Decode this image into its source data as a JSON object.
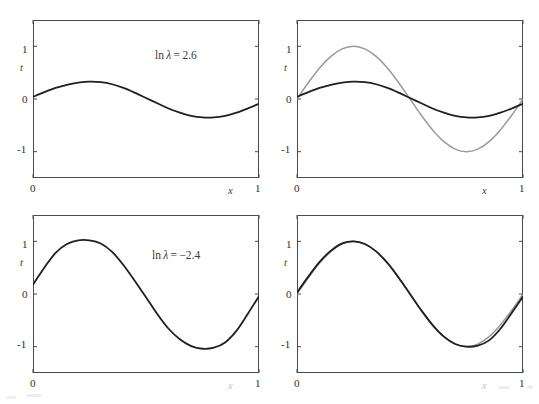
{
  "figure": {
    "title": "",
    "background_color": "#ffffff",
    "width": 539,
    "height": 404
  },
  "style": {
    "true_curve_color": "#9a9a9a",
    "fit_curve_color": "#6e6e6e",
    "average_curve_color": "#1f1f1f",
    "frame_color": "#4a4a4a",
    "text_color": "#2f2f2f"
  },
  "panels": [
    {
      "id": "top-left",
      "role": "individual-fits",
      "annotation_prefix": "ln",
      "annotation_symbol": "λ",
      "annotation_equals": "=",
      "annotation_value": "2.6",
      "annotation_full": "ln λ = 2.6",
      "xlabel": "x",
      "ylabel": "t",
      "xticks": [
        "0",
        "1"
      ],
      "yticks": [
        "1",
        "0",
        "-1"
      ],
      "xlabel_faded": false,
      "xticks_faded": false
    },
    {
      "id": "top-right",
      "role": "average-vs-truth",
      "annotation_full": "",
      "xlabel": "x",
      "ylabel": "t",
      "xticks": [
        "0",
        "1"
      ],
      "yticks": [
        "1",
        "0",
        "-1"
      ],
      "xlabel_faded": false,
      "xticks_faded": false
    },
    {
      "id": "bottom-left",
      "role": "individual-fits",
      "annotation_prefix": "ln",
      "annotation_symbol": "λ",
      "annotation_equals": "=",
      "annotation_value": "−2.4",
      "annotation_full": "ln λ = −2.4",
      "xlabel": "x",
      "ylabel": "t",
      "xticks": [
        "0",
        "1"
      ],
      "yticks": [
        "1",
        "0",
        "-1"
      ],
      "xlabel_faded": true,
      "xticks_faded": false
    },
    {
      "id": "bottom-right",
      "role": "average-vs-truth",
      "annotation_full": "",
      "xlabel": "x",
      "ylabel": "t",
      "xticks": [
        "0",
        "1"
      ],
      "yticks": [
        "1",
        "0",
        "-1"
      ],
      "xlabel_faded": true,
      "xticks_faded": false
    }
  ],
  "chart_data": {
    "type": "line",
    "xlabel": "x",
    "ylabel": "t",
    "xlim": [
      0,
      1
    ],
    "ylim": [
      -1.5,
      1.5
    ],
    "grid": false,
    "legend": "none",
    "true_function": {
      "name": "sin(2πx)",
      "amplitude": 1.0,
      "periods": 1,
      "color": "#9a9a9a",
      "x": [
        0,
        0.05,
        0.1,
        0.15,
        0.2,
        0.25,
        0.3,
        0.35,
        0.4,
        0.45,
        0.5,
        0.55,
        0.6,
        0.65,
        0.7,
        0.75,
        0.8,
        0.85,
        0.9,
        0.95,
        1.0
      ],
      "y": [
        0.0,
        0.309,
        0.588,
        0.809,
        0.951,
        1.0,
        0.951,
        0.809,
        0.588,
        0.309,
        0.0,
        -0.309,
        -0.588,
        -0.809,
        -0.951,
        -1.0,
        -0.951,
        -0.809,
        -0.588,
        -0.309,
        0.0
      ]
    },
    "panels": [
      {
        "id": "top-left",
        "position": "top-left",
        "annotation": "ln λ = 2.6",
        "ln_lambda": 2.6,
        "shows": "20 individual regularized fits",
        "num_curves": 20,
        "variance": "low",
        "bias": "high",
        "series": [
          {
            "name": "mean-fit",
            "color": "#1f1f1f",
            "x": [
              0,
              0.05,
              0.1,
              0.15,
              0.2,
              0.25,
              0.3,
              0.35,
              0.4,
              0.45,
              0.5,
              0.55,
              0.6,
              0.65,
              0.7,
              0.75,
              0.8,
              0.85,
              0.9,
              0.95,
              1.0
            ],
            "y": [
              0.04,
              0.13,
              0.21,
              0.27,
              0.31,
              0.33,
              0.32,
              0.28,
              0.21,
              0.12,
              0.02,
              -0.08,
              -0.18,
              -0.26,
              -0.32,
              -0.35,
              -0.35,
              -0.32,
              -0.26,
              -0.18,
              -0.09
            ]
          }
        ],
        "spread_amplitude": 0.09
      },
      {
        "id": "top-right",
        "position": "top-right",
        "annotation": "",
        "ln_lambda": 2.6,
        "shows": "average fit versus true sinusoid",
        "num_curves": 2,
        "series": [
          {
            "name": "true-sinusoid",
            "color": "#9a9a9a",
            "x": [
              0,
              0.05,
              0.1,
              0.15,
              0.2,
              0.25,
              0.3,
              0.35,
              0.4,
              0.45,
              0.5,
              0.55,
              0.6,
              0.65,
              0.7,
              0.75,
              0.8,
              0.85,
              0.9,
              0.95,
              1.0
            ],
            "y": [
              0.0,
              0.309,
              0.588,
              0.809,
              0.951,
              1.0,
              0.951,
              0.809,
              0.588,
              0.309,
              0.0,
              -0.309,
              -0.588,
              -0.809,
              -0.951,
              -1.0,
              -0.951,
              -0.809,
              -0.588,
              -0.309,
              0.0
            ]
          },
          {
            "name": "average-fit",
            "color": "#1f1f1f",
            "x": [
              0,
              0.05,
              0.1,
              0.15,
              0.2,
              0.25,
              0.3,
              0.35,
              0.4,
              0.45,
              0.5,
              0.55,
              0.6,
              0.65,
              0.7,
              0.75,
              0.8,
              0.85,
              0.9,
              0.95,
              1.0
            ],
            "y": [
              0.04,
              0.13,
              0.21,
              0.27,
              0.31,
              0.33,
              0.32,
              0.28,
              0.21,
              0.12,
              0.02,
              -0.08,
              -0.18,
              -0.26,
              -0.32,
              -0.35,
              -0.35,
              -0.32,
              -0.26,
              -0.18,
              -0.09
            ]
          }
        ]
      },
      {
        "id": "bottom-left",
        "position": "bottom-left",
        "annotation": "ln λ = −2.4",
        "ln_lambda": -2.4,
        "shows": "20 individual regularized fits",
        "num_curves": 20,
        "variance": "high",
        "bias": "low",
        "series": [
          {
            "name": "mean-fit",
            "color": "#1f1f1f",
            "x": [
              0,
              0.05,
              0.1,
              0.15,
              0.2,
              0.25,
              0.3,
              0.35,
              0.4,
              0.45,
              0.5,
              0.55,
              0.6,
              0.65,
              0.7,
              0.75,
              0.8,
              0.85,
              0.9,
              0.95,
              1.0
            ],
            "y": [
              0.18,
              0.5,
              0.78,
              0.95,
              1.02,
              1.02,
              0.96,
              0.8,
              0.55,
              0.25,
              -0.06,
              -0.38,
              -0.66,
              -0.86,
              -0.99,
              -1.04,
              -1.02,
              -0.92,
              -0.7,
              -0.38,
              -0.04
            ]
          }
        ],
        "spread_amplitude": 0.42
      },
      {
        "id": "bottom-right",
        "position": "bottom-right",
        "annotation": "",
        "ln_lambda": -2.4,
        "shows": "average fit versus true sinusoid (nearly coincident)",
        "num_curves": 2,
        "series": [
          {
            "name": "true-sinusoid",
            "color": "#9a9a9a",
            "x": [
              0,
              0.05,
              0.1,
              0.15,
              0.2,
              0.25,
              0.3,
              0.35,
              0.4,
              0.45,
              0.5,
              0.55,
              0.6,
              0.65,
              0.7,
              0.75,
              0.8,
              0.85,
              0.9,
              0.95,
              1.0
            ],
            "y": [
              0.0,
              0.309,
              0.588,
              0.809,
              0.951,
              1.0,
              0.951,
              0.809,
              0.588,
              0.309,
              0.0,
              -0.309,
              -0.588,
              -0.809,
              -0.951,
              -1.0,
              -0.951,
              -0.809,
              -0.588,
              -0.309,
              0.0
            ]
          },
          {
            "name": "average-fit",
            "color": "#1f1f1f",
            "x": [
              0,
              0.05,
              0.1,
              0.15,
              0.2,
              0.25,
              0.3,
              0.35,
              0.4,
              0.45,
              0.5,
              0.55,
              0.6,
              0.65,
              0.7,
              0.75,
              0.8,
              0.85,
              0.9,
              0.95,
              1.0
            ],
            "y": [
              0.03,
              0.33,
              0.61,
              0.82,
              0.96,
              1.0,
              0.95,
              0.81,
              0.59,
              0.31,
              0.0,
              -0.31,
              -0.59,
              -0.81,
              -0.95,
              -1.0,
              -0.98,
              -0.88,
              -0.66,
              -0.36,
              -0.05
            ]
          }
        ]
      }
    ]
  }
}
